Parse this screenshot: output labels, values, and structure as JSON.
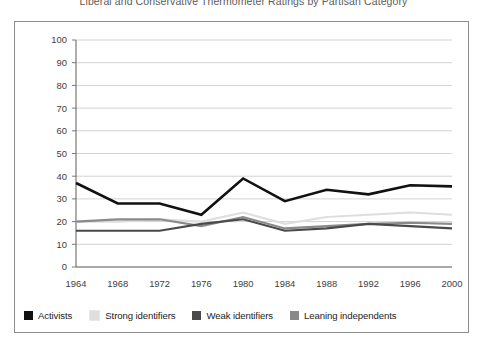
{
  "chart_title": "Liberal and Conservative Thermometer Ratings by Partisan Category",
  "axes": {
    "ylabel_line1": "Average Difference Between Liberal",
    "ylabel_line2": "and Conservative Thermometer Ratings",
    "xlabel": "",
    "yticks": [
      0,
      10,
      20,
      30,
      40,
      50,
      60,
      70,
      80,
      90,
      100
    ],
    "xticks": [
      "1964",
      "1968",
      "1972",
      "1976",
      "1980",
      "1984",
      "1988",
      "1992",
      "1996",
      "2000"
    ]
  },
  "legend": {
    "position": "bottom",
    "items": [
      {
        "label": "Activists",
        "color": "#111111"
      },
      {
        "label": "Strong identifiers",
        "color": "#dedede"
      },
      {
        "label": "Weak identifiers",
        "color": "#4a4a4a"
      },
      {
        "label": "Leaning independents",
        "color": "#8a8a8a"
      }
    ]
  },
  "chart_data": {
    "type": "line",
    "title": "Liberal and Conservative Thermometer Ratings by Partisan Category",
    "xlabel": "",
    "ylabel": "Average Difference Between Liberal and Conservative Thermometer Ratings",
    "categories": [
      "1964",
      "1968",
      "1972",
      "1976",
      "1980",
      "1984",
      "1988",
      "1992",
      "1996",
      "2000"
    ],
    "x": [
      1964,
      1968,
      1972,
      1976,
      1980,
      1984,
      1988,
      1992,
      1996,
      2000
    ],
    "ylim": [
      0,
      100
    ],
    "yticks": [
      0,
      10,
      20,
      30,
      40,
      50,
      60,
      70,
      80,
      90,
      100
    ],
    "grid": true,
    "legend_position": "bottom",
    "series": [
      {
        "name": "Activists",
        "color": "#111111",
        "values": [
          37,
          28,
          28,
          23,
          39,
          29,
          34,
          32,
          36,
          35.5
        ]
      },
      {
        "name": "Strong identifiers",
        "color": "#dedede",
        "values": [
          20,
          20,
          21,
          20,
          24,
          19,
          22,
          23,
          24,
          23
        ]
      },
      {
        "name": "Weak identifiers",
        "color": "#4a4a4a",
        "values": [
          16,
          16,
          16,
          19,
          21,
          16,
          17,
          19,
          18,
          17
        ]
      },
      {
        "name": "Leaning independents",
        "color": "#8a8a8a",
        "values": [
          20,
          21,
          21,
          18,
          22,
          17,
          18,
          19,
          19.5,
          19
        ]
      }
    ]
  }
}
